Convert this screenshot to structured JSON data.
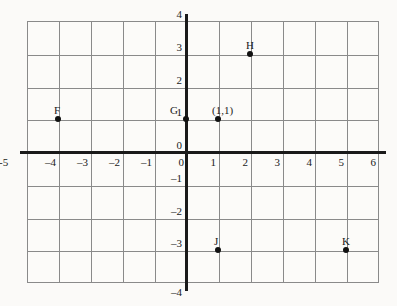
{
  "chart_data": {
    "type": "scatter",
    "title": "",
    "xlabel": "",
    "ylabel": "",
    "xlim": [
      -5,
      6
    ],
    "ylim": [
      -4,
      4
    ],
    "grid": true,
    "legend": "none",
    "x_ticks": [
      "-5",
      "–4",
      "–3",
      "–2",
      "–1",
      "0",
      "1",
      "2",
      "3",
      "4",
      "5",
      "6"
    ],
    "x_tick_values": [
      -5,
      -4,
      -3,
      -2,
      -1,
      0,
      1,
      2,
      3,
      4,
      5,
      6
    ],
    "y_ticks": [
      "4",
      "3",
      "2",
      "1",
      "0",
      "–1",
      "–2",
      "–3",
      "–4"
    ],
    "y_tick_values": [
      4,
      3,
      2,
      1,
      0,
      -1,
      -2,
      -3,
      -4
    ],
    "points": [
      {
        "label": "F",
        "x": -4,
        "y": 1,
        "label_dx": -4,
        "label_dy": -14
      },
      {
        "label": "G",
        "x": 0,
        "y": 1,
        "label_dx": -16,
        "label_dy": -14
      },
      {
        "label": "(1,1)",
        "x": 1,
        "y": 1,
        "label_dx": -6,
        "label_dy": -14
      },
      {
        "label": "H",
        "x": 2,
        "y": 3,
        "label_dx": -4,
        "label_dy": -14
      },
      {
        "label": "J",
        "x": 1,
        "y": -3,
        "label_dx": -4,
        "label_dy": -14
      },
      {
        "label": "K",
        "x": 5,
        "y": -3,
        "label_dx": -4,
        "label_dy": -14
      }
    ],
    "axis_color": "#1a1a1a",
    "grid_color": "#8a8a8a",
    "point_color": "#111111",
    "background_color": "#fbfaf8"
  },
  "geometry": {
    "origin_x": 186,
    "origin_y": 152,
    "cell_w": 32,
    "cell_h": 32.75,
    "grid_left": 27,
    "grid_top": 21,
    "grid_width": 352,
    "grid_height": 262
  }
}
